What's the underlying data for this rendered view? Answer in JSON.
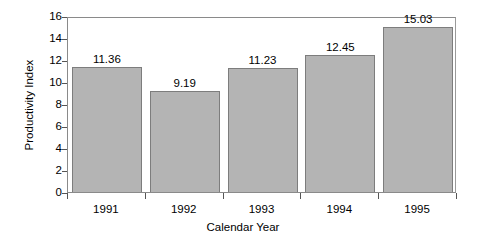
{
  "chart_data": {
    "type": "bar",
    "title": "",
    "xlabel": "Calendar Year",
    "ylabel": "Productivity Index",
    "categories": [
      "1991",
      "1992",
      "1993",
      "1994",
      "1995"
    ],
    "values": [
      11.36,
      9.19,
      11.23,
      12.45,
      15.03
    ],
    "value_labels": [
      "11.36",
      "9.19",
      "11.23",
      "12.45",
      "15.03"
    ],
    "ylim": [
      0,
      16
    ],
    "yticks": [
      0,
      2,
      4,
      6,
      8,
      10,
      12,
      14,
      16
    ],
    "ytick_labels": [
      "0",
      "2",
      "4",
      "6",
      "8",
      "10",
      "12",
      "14",
      "16"
    ],
    "grid": false,
    "legend": "none",
    "bar_color": "#b4b4b4",
    "bar_edge_color": "#7d7d7d",
    "axis_color": "#8a8a8a",
    "text_color": "#000000",
    "background": "#ffffff"
  }
}
